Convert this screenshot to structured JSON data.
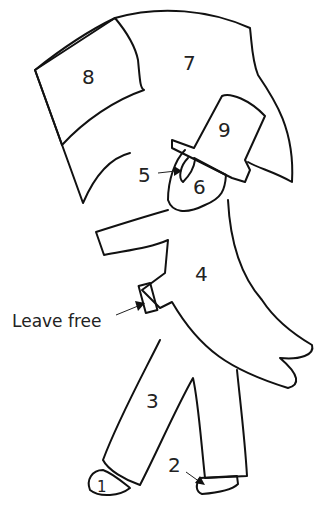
{
  "diagram": {
    "title": "",
    "pieces": [
      {
        "number": "1",
        "part": "left shoe"
      },
      {
        "number": "2",
        "part": "right shoe"
      },
      {
        "number": "3",
        "part": "trousers"
      },
      {
        "number": "4",
        "part": "coat"
      },
      {
        "number": "5",
        "part": "ear / hair"
      },
      {
        "number": "6",
        "part": "face"
      },
      {
        "number": "7",
        "part": "flag"
      },
      {
        "number": "8",
        "part": "flag canton"
      },
      {
        "number": "9",
        "part": "top hat"
      }
    ],
    "annotations": [
      {
        "text": "Leave free",
        "points_to": "coat tab"
      }
    ]
  }
}
